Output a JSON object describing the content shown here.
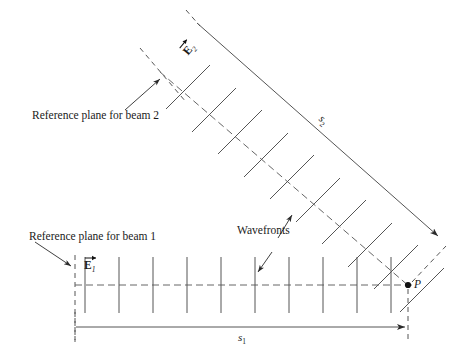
{
  "figure": {
    "type": "optics-interference-diagram",
    "width": 462,
    "height": 363,
    "background": "#ffffff",
    "ink_color": "#1a1a1a",
    "line_color": "#555555"
  },
  "labels": {
    "ref_plane_beam1": "Reference plane for beam 1",
    "ref_plane_beam2": "Reference plane for beam 2",
    "wavefronts": "Wavefronts",
    "point_p": "P",
    "field_e1_symbol": "E",
    "field_e1_sub": "1",
    "field_e2_symbol": "E",
    "field_e2_sub": "2",
    "distance_s1_symbol": "s",
    "distance_s1_sub": "1",
    "distance_s2_symbol": "s",
    "distance_s2_sub": "2"
  },
  "geometry": {
    "point_p": {
      "x": 408,
      "y": 285
    },
    "beam1": {
      "axis_start": {
        "x": 75,
        "y": 285
      },
      "axis_end": {
        "x": 412,
        "y": 285
      },
      "reference_plane_x": 75,
      "wavefront_count": 10,
      "wavefront_first_x": 85,
      "wavefront_spacing": 34,
      "wavefront_half_height": 28
    },
    "beam2": {
      "axis_start": {
        "x": 160,
        "y": 72
      },
      "axis_end": {
        "x": 408,
        "y": 285
      },
      "angle_deg": 40.5,
      "wavefront_count": 9,
      "wavefront_half_length": 29
    },
    "dimension_s1": {
      "y": 327,
      "x_start": 75,
      "x_end": 408
    },
    "dimension_s2": {
      "start": {
        "x": 196,
        "y": 22
      },
      "end": {
        "x": 441,
        "y": 238
      }
    }
  }
}
